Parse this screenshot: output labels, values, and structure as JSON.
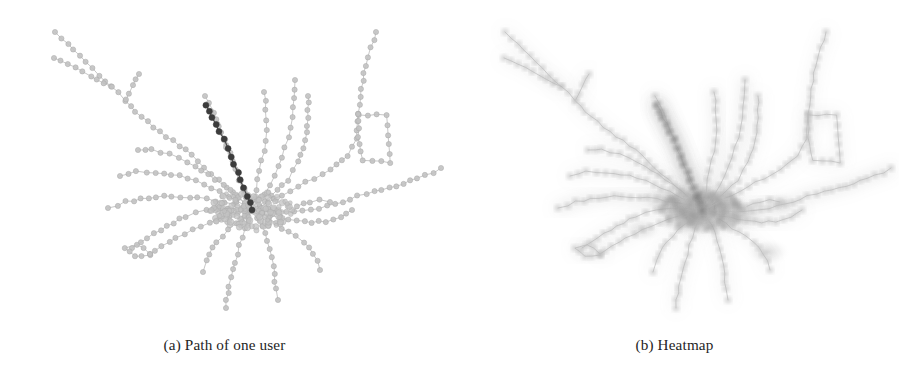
{
  "figure": {
    "background_color": "#ffffff",
    "panel_count": 2
  },
  "panels": [
    {
      "id": "panel-a",
      "caption": "(a) Path of one user",
      "caption_prefix": "(a)",
      "caption_text": "Path of one user",
      "render_mode": "path",
      "description": "Transit network graph with one user's route highlighted in dark gray"
    },
    {
      "id": "panel-b",
      "caption": "(b) Heatmap",
      "caption_prefix": "(b)",
      "caption_text": "Heatmap",
      "render_mode": "heatmap",
      "description": "Same transit network rendered as a blurred intensity heatmap"
    }
  ],
  "chart_data": {
    "type": "scatter",
    "subtype": "node-link-network-graph",
    "title": "",
    "xlabel": "",
    "ylabel": "",
    "grid": false,
    "legend": false,
    "axes_visible": false,
    "xlim": [
      0,
      449
    ],
    "ylim": [
      0,
      318
    ],
    "colors": {
      "background": "#ffffff",
      "edge_light": "#b9b9b9",
      "node_light": "#c2c2c2",
      "node_light_stroke": "#a8a8a8",
      "edge_dark": "#4a4a4a",
      "node_dark": "#3c3c3c",
      "heat_low": "#d8d8d8",
      "heat_mid": "#9a9a9a",
      "heat_high": "#5a5a5a",
      "caption_text": "#242424"
    },
    "hub": {
      "x": 252,
      "y": 206,
      "radius": 34,
      "label": "central hub"
    },
    "node_radius": 2.6,
    "highlighted_path_node_count": 11,
    "total_node_count": 268,
    "branch_count": 21,
    "loops": [
      {
        "name": "rectangle-loop-upper-right",
        "x": 360,
        "y": 130,
        "w": 30,
        "h": 42
      },
      {
        "name": "triangle-loop-lower-left",
        "x": 125,
        "y": 247,
        "size": 16
      }
    ],
    "branches": [
      {
        "name": "nw-long-arm",
        "points": [
          [
            252,
            206
          ],
          [
            226,
            183
          ],
          [
            205,
            163
          ],
          [
            186,
            146
          ],
          [
            160,
            128
          ],
          [
            141,
            113
          ],
          [
            126,
            96
          ],
          [
            112,
            82
          ],
          [
            99,
            71
          ],
          [
            55,
            28
          ]
        ],
        "weight": 1
      },
      {
        "name": "nw-arm-second-tip",
        "points": [
          [
            112,
            82
          ],
          [
            54,
            54
          ]
        ],
        "weight": 1
      },
      {
        "name": "nw-arm-spur",
        "points": [
          [
            126,
            96
          ],
          [
            133,
            82
          ],
          [
            139,
            70
          ]
        ],
        "weight": 1
      },
      {
        "name": "n-arm-1",
        "points": [
          [
            252,
            206
          ],
          [
            243,
            186
          ],
          [
            236,
            166
          ],
          [
            230,
            148
          ],
          [
            222,
            128
          ],
          [
            213,
            108
          ],
          [
            205,
            92
          ]
        ],
        "weight": 2
      },
      {
        "name": "n-arm-2-highlighted",
        "points": [
          [
            252,
            206
          ],
          [
            248,
            192
          ],
          [
            241,
            176
          ],
          [
            234,
            160
          ],
          [
            227,
            144
          ],
          [
            220,
            128
          ],
          [
            213,
            113
          ],
          [
            207,
            101
          ]
        ],
        "weight": 3,
        "highlighted": true
      },
      {
        "name": "n-arm-3",
        "points": [
          [
            252,
            206
          ],
          [
            256,
            186
          ],
          [
            260,
            166
          ],
          [
            264,
            146
          ],
          [
            266,
            126
          ],
          [
            266,
            106
          ],
          [
            264,
            88
          ]
        ],
        "weight": 2
      },
      {
        "name": "n-arm-4",
        "points": [
          [
            252,
            206
          ],
          [
            264,
            190
          ],
          [
            274,
            172
          ],
          [
            282,
            154
          ],
          [
            288,
            134
          ],
          [
            292,
            114
          ],
          [
            294,
            94
          ],
          [
            295,
            76
          ]
        ],
        "weight": 2
      },
      {
        "name": "n-arm-5",
        "points": [
          [
            252,
            206
          ],
          [
            272,
            192
          ],
          [
            288,
            176
          ],
          [
            298,
            158
          ],
          [
            305,
            136
          ],
          [
            308,
            114
          ],
          [
            308,
            92
          ]
        ],
        "weight": 1
      },
      {
        "name": "ne-arm-loop",
        "points": [
          [
            252,
            206
          ],
          [
            282,
            192
          ],
          [
            306,
            178
          ],
          [
            330,
            166
          ],
          [
            348,
            152
          ],
          [
            356,
            134
          ],
          [
            358,
            110
          ],
          [
            360,
            92
          ],
          [
            364,
            70
          ],
          [
            371,
            44
          ],
          [
            376,
            28
          ]
        ],
        "weight": 1
      },
      {
        "name": "ne-rect-loop",
        "points": [
          [
            358,
            110
          ],
          [
            387,
            112
          ],
          [
            389,
            140
          ],
          [
            390,
            158
          ],
          [
            362,
            156
          ],
          [
            358,
            132
          ],
          [
            358,
            110
          ]
        ],
        "weight": 1
      },
      {
        "name": "e-long-arm",
        "points": [
          [
            252,
            206
          ],
          [
            286,
            208
          ],
          [
            312,
            206
          ],
          [
            336,
            200
          ],
          [
            358,
            192
          ],
          [
            382,
            186
          ],
          [
            404,
            180
          ],
          [
            424,
            172
          ],
          [
            441,
            164
          ]
        ],
        "weight": 2
      },
      {
        "name": "e-spur",
        "points": [
          [
            296,
            202
          ],
          [
            310,
            198
          ],
          [
            320,
            196
          ],
          [
            330,
            198
          ]
        ],
        "weight": 1
      },
      {
        "name": "ese-arm",
        "points": [
          [
            252,
            206
          ],
          [
            280,
            214
          ],
          [
            304,
            218
          ],
          [
            326,
            218
          ],
          [
            342,
            214
          ],
          [
            352,
            206
          ]
        ],
        "weight": 1
      },
      {
        "name": "se-arm-1",
        "points": [
          [
            252,
            206
          ],
          [
            276,
            220
          ],
          [
            296,
            232
          ],
          [
            310,
            244
          ],
          [
            318,
            256
          ],
          [
            320,
            266
          ]
        ],
        "weight": 1
      },
      {
        "name": "se-arm-2",
        "points": [
          [
            252,
            206
          ],
          [
            262,
            222
          ],
          [
            268,
            238
          ],
          [
            272,
            254
          ],
          [
            274,
            270
          ],
          [
            276,
            284
          ],
          [
            278,
            296
          ]
        ],
        "weight": 1
      },
      {
        "name": "s-arm-1",
        "points": [
          [
            252,
            206
          ],
          [
            246,
            224
          ],
          [
            240,
            242
          ],
          [
            235,
            258
          ],
          [
            231,
            274
          ],
          [
            228,
            290
          ],
          [
            226,
            304
          ]
        ],
        "weight": 1
      },
      {
        "name": "s-arm-2",
        "points": [
          [
            252,
            206
          ],
          [
            236,
            220
          ],
          [
            222,
            232
          ],
          [
            212,
            244
          ],
          [
            206,
            256
          ],
          [
            203,
            268
          ]
        ],
        "weight": 1
      },
      {
        "name": "sw-arm-1",
        "points": [
          [
            252,
            206
          ],
          [
            230,
            212
          ],
          [
            210,
            218
          ],
          [
            192,
            226
          ],
          [
            176,
            234
          ],
          [
            162,
            242
          ],
          [
            150,
            250
          ]
        ],
        "weight": 1
      },
      {
        "name": "sw-arm-2",
        "points": [
          [
            252,
            206
          ],
          [
            228,
            204
          ],
          [
            206,
            206
          ],
          [
            186,
            212
          ],
          [
            166,
            222
          ],
          [
            148,
            234
          ],
          [
            132,
            244
          ]
        ],
        "weight": 1
      },
      {
        "name": "w-arm-1",
        "points": [
          [
            252,
            206
          ],
          [
            224,
            198
          ],
          [
            198,
            194
          ],
          [
            172,
            192
          ],
          [
            148,
            194
          ],
          [
            126,
            198
          ],
          [
            108,
            204
          ]
        ],
        "weight": 2
      },
      {
        "name": "w-arm-2",
        "points": [
          [
            252,
            206
          ],
          [
            228,
            192
          ],
          [
            204,
            180
          ],
          [
            180,
            172
          ],
          [
            156,
            168
          ],
          [
            136,
            168
          ],
          [
            120,
            172
          ]
        ],
        "weight": 1
      },
      {
        "name": "wnw-arm",
        "points": [
          [
            252,
            206
          ],
          [
            230,
            186
          ],
          [
            208,
            170
          ],
          [
            188,
            158
          ],
          [
            170,
            150
          ],
          [
            152,
            146
          ],
          [
            138,
            146
          ]
        ],
        "weight": 1
      },
      {
        "name": "triangle-spur",
        "points": [
          [
            150,
            250
          ],
          [
            134,
            252
          ],
          [
            124,
            244
          ],
          [
            136,
            240
          ],
          [
            150,
            250
          ]
        ],
        "weight": 1
      }
    ],
    "highlighted_path": {
      "name": "path-of-one-user",
      "color": "#3c3c3c",
      "points": [
        [
          207,
          101
        ],
        [
          213,
          113
        ],
        [
          220,
          128
        ],
        [
          227,
          144
        ],
        [
          234,
          160
        ],
        [
          241,
          176
        ],
        [
          248,
          192
        ],
        [
          252,
          206
        ]
      ],
      "node_count": 11
    },
    "heat_centers": [
      {
        "x": 252,
        "y": 206,
        "intensity": 1.0,
        "radius": 40
      },
      {
        "x": 268,
        "y": 200,
        "intensity": 0.85,
        "radius": 26
      },
      {
        "x": 236,
        "y": 214,
        "intensity": 0.7,
        "radius": 24
      },
      {
        "x": 290,
        "y": 212,
        "intensity": 0.55,
        "radius": 22
      },
      {
        "x": 214,
        "y": 196,
        "intensity": 0.5,
        "radius": 20
      },
      {
        "x": 318,
        "y": 248,
        "intensity": 0.45,
        "radius": 18
      },
      {
        "x": 192,
        "y": 226,
        "intensity": 0.4,
        "radius": 16
      },
      {
        "x": 330,
        "y": 200,
        "intensity": 0.35,
        "radius": 16
      }
    ]
  }
}
